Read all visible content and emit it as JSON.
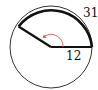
{
  "figure": {
    "type": "circle-sector-diagram",
    "arc_length_label": "31",
    "radius_label": "12",
    "angle_marker": "curved arrow (counterclockwise) indicating central angle",
    "colors": {
      "stroke": "#111111",
      "thin_circle": "#333333",
      "angle_arrow": "#d9534f",
      "background": "#ffffff"
    }
  }
}
